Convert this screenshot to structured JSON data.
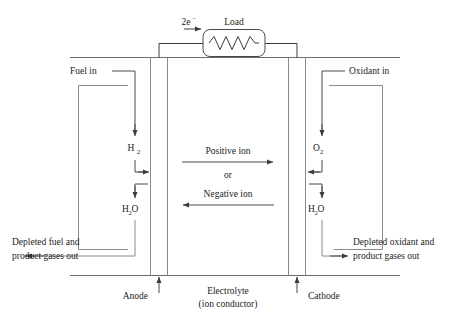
{
  "diagram": {
    "type": "schematic",
    "background_color": "#ffffff",
    "line_color": "#3c3c3c",
    "structure_color": "#6b6b6b",
    "labels": {
      "electrons": "2e",
      "electrons_charge": "−",
      "load": "Load",
      "fuel_in": "Fuel in",
      "oxidant_in": "Oxidant in",
      "hydrogen": "H",
      "hydrogen_sub": "2",
      "oxygen": "O",
      "oxygen_sub": "2",
      "water_h": "H",
      "water_sub": "2",
      "water_o": "O",
      "positive_ion": "Positive ion",
      "conjunction": "or",
      "negative_ion": "Negative ion",
      "depleted_fuel_line1": "Depleted fuel and",
      "depleted_fuel_line2": "product gases out",
      "depleted_oxidant_line1": "Depleted oxidant and",
      "depleted_oxidant_line2": "product gases out",
      "anode": "Anode",
      "cathode": "Cathode",
      "electrolyte_line1": "Electrolyte",
      "electrolyte_line2": "(ion conductor)"
    },
    "components": [
      {
        "name": "external-circuit",
        "description": "External load circuit connecting anode and cathode across the top",
        "label": "Load",
        "current_label": "2e−",
        "current_direction": "right"
      },
      {
        "name": "anode",
        "label": "Anode",
        "side": "left",
        "inlet": "Fuel in",
        "inlet_species": "H2",
        "outlet_species": "H2O",
        "outlet": "Depleted fuel and product gases out"
      },
      {
        "name": "cathode",
        "label": "Cathode",
        "side": "right",
        "inlet": "Oxidant in",
        "inlet_species": "O2",
        "outlet_species": "H2O",
        "outlet": "Depleted oxidant and product gases out"
      },
      {
        "name": "electrolyte",
        "label": "Electrolyte (ion conductor)",
        "ion_flows": [
          {
            "species": "Positive ion",
            "direction": "right"
          },
          {
            "species": "Negative ion",
            "direction": "left"
          }
        ]
      }
    ]
  }
}
